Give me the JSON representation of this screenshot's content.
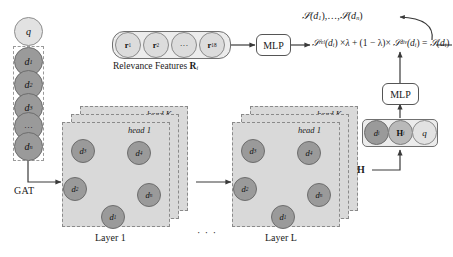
{
  "diagram": {
    "colors": {
      "node_dark": "#9a9a9a",
      "node_mid": "#b9b9b9",
      "node_light": "#e2e2e2",
      "panel": "#d9d9d9",
      "edge": "#8c8c8c",
      "arrow": "#3a3a3a"
    }
  },
  "input_chain": {
    "query_label": "q",
    "doc_labels": [
      "d1",
      "d2",
      "d3",
      "dots",
      "dn"
    ],
    "doc_labels_text": {
      "d1": "d",
      "d1s": "1",
      "d2": "d",
      "d2s": "2",
      "d3": "d",
      "d3s": "3",
      "dots": "···",
      "dn": "d",
      "dns": "n"
    },
    "gat_label": "GAT"
  },
  "relevance": {
    "features": [
      {
        "base": "r",
        "sub": "1"
      },
      {
        "base": "r",
        "sub": "2"
      },
      {
        "base": "···",
        "sub": ""
      },
      {
        "base": "r",
        "sub": "18"
      }
    ],
    "caption_prefix": "Relevance Features ",
    "caption_symbol": "R",
    "caption_sub": "i",
    "mlp_label": "MLP"
  },
  "formula": {
    "output_list": "𝒮(d₁),…,𝒮(dₙ)",
    "output_list_parts": {
      "s1": "𝒮",
      "a1": "(d",
      "sub1": "1",
      "a2": "),",
      "dots": "…",
      "comma": ",",
      "s2": "𝒮",
      "a3": "(d",
      "sub2": "n",
      "a4": ")"
    },
    "score_rel_symbol": "𝒮",
    "score_rel_sup": "rel",
    "score_rel_arg": "(d",
    "score_rel_arg_sub": "i",
    "times": "×",
    "lambda": "λ",
    "plus": "+",
    "one_minus_lambda": "(1 − λ)×",
    "score_div_symbol": "𝒮",
    "score_div_sup": "div",
    "equals": "=",
    "score_total_symbol": "𝒮",
    "full_text": "S^rel(d_i) × λ + (1 − λ) × S^div(d_i) = S(d_i)"
  },
  "layers": {
    "layer1": {
      "caption": "Layer 1",
      "head_front_label": "head 1",
      "head_back_label": "head K",
      "head_dots": "· · ·",
      "nodes": [
        {
          "base": "d",
          "sub": "3",
          "x": 22,
          "y": 18
        },
        {
          "base": "d",
          "sub": "4",
          "x": 78,
          "y": 20
        },
        {
          "base": "d",
          "sub": "2",
          "x": 14,
          "y": 56
        },
        {
          "base": "d",
          "sub": "n",
          "x": 88,
          "y": 62
        },
        {
          "base": "d",
          "sub": "1",
          "x": 52,
          "y": 84
        }
      ],
      "edges": [
        [
          0,
          1
        ],
        [
          0,
          2
        ],
        [
          0,
          3
        ],
        [
          0,
          4
        ],
        [
          1,
          2
        ],
        [
          1,
          4
        ],
        [
          2,
          3
        ],
        [
          2,
          4
        ],
        [
          3,
          4
        ],
        [
          1,
          3
        ]
      ]
    },
    "between_layers_dots": "· · ·",
    "layerL": {
      "caption": "Layer L",
      "head_front_label": "head 1",
      "head_back_label": "head K",
      "head_dots": "· · ·",
      "nodes": [
        {
          "base": "d",
          "sub": "3",
          "x": 22,
          "y": 18
        },
        {
          "base": "d",
          "sub": "4",
          "x": 78,
          "y": 20
        },
        {
          "base": "d",
          "sub": "2",
          "x": 14,
          "y": 56
        },
        {
          "base": "d",
          "sub": "n",
          "x": 88,
          "y": 62
        },
        {
          "base": "d",
          "sub": "1",
          "x": 52,
          "y": 84
        }
      ],
      "edges": [
        [
          0,
          1
        ],
        [
          0,
          2
        ],
        [
          0,
          3
        ],
        [
          0,
          4
        ],
        [
          1,
          2
        ],
        [
          1,
          4
        ],
        [
          2,
          3
        ],
        [
          2,
          4
        ],
        [
          3,
          4
        ],
        [
          1,
          3
        ]
      ]
    }
  },
  "output_stage": {
    "h_label": "H",
    "triple": [
      {
        "base": "d",
        "sub": "i",
        "tone": "dark"
      },
      {
        "base": "H",
        "sub": "i",
        "tone": "mid",
        "bold": true
      },
      {
        "base": "q",
        "sub": "",
        "tone": "light"
      }
    ],
    "mlp_label": "MLP"
  }
}
